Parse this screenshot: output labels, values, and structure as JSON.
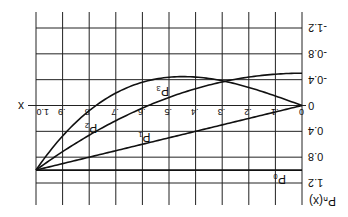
{
  "chart_data": {
    "type": "line",
    "orientation_note": "figure rendered rotated 180 degrees",
    "title": "",
    "xlabel": "x",
    "ylabel": "P_n(x)",
    "xlim": [
      0,
      1.0
    ],
    "ylim": [
      -1.2,
      1.2
    ],
    "x_ticks": [
      "0",
      ".1",
      ".2",
      ".3",
      ".4",
      ".5",
      ".6",
      ".7",
      ".8",
      ".9",
      "1.0"
    ],
    "y_ticks": [
      "-1.2",
      "-0.8",
      "-0.4",
      "0",
      "0.4",
      "0.8",
      "1.2"
    ],
    "grid": true,
    "series": [
      {
        "name": "P0",
        "label": "P₀",
        "formula": "1",
        "x": [
          0,
          0.2,
          0.4,
          0.6,
          0.8,
          1.0
        ],
        "values": [
          1,
          1,
          1,
          1,
          1,
          1
        ]
      },
      {
        "name": "P1",
        "label": "P₁",
        "formula": "x",
        "x": [
          0,
          0.2,
          0.4,
          0.6,
          0.8,
          1.0
        ],
        "values": [
          0,
          0.2,
          0.4,
          0.6,
          0.8,
          1.0
        ]
      },
      {
        "name": "P2",
        "label": "P₂",
        "formula": "(3x^2-1)/2",
        "x": [
          0,
          0.2,
          0.4,
          0.6,
          0.8,
          1.0
        ],
        "values": [
          -0.5,
          -0.44,
          -0.26,
          0.04,
          0.46,
          1.0
        ]
      },
      {
        "name": "P3",
        "label": "P₃",
        "formula": "(5x^3-3x)/2",
        "x": [
          0,
          0.2,
          0.4,
          0.6,
          0.8,
          1.0
        ],
        "values": [
          0,
          -0.28,
          -0.44,
          -0.36,
          0.08,
          1.0
        ]
      }
    ]
  }
}
